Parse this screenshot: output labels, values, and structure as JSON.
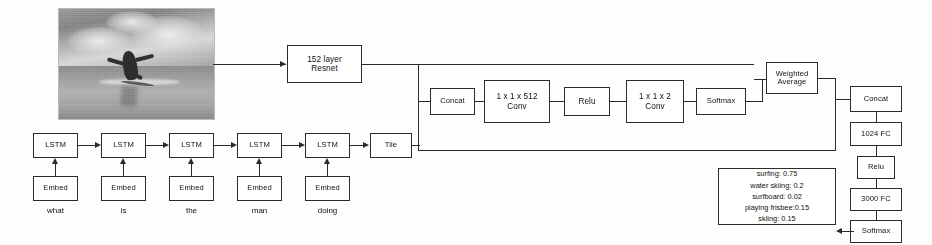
{
  "diagram": {
    "image_node": {
      "name": "surfer-photo",
      "alt": "grayscale photo of a man surfing on a wave"
    },
    "vision": {
      "resnet": "152 layer\nResnet"
    },
    "attention_row": [
      {
        "id": "concat",
        "label": "Concat"
      },
      {
        "id": "conv512",
        "label": "1 x 1 x 512\nConv"
      },
      {
        "id": "relu",
        "label": "Relu"
      },
      {
        "id": "conv2",
        "label": "1 x 1 x 2\nConv"
      },
      {
        "id": "softmax",
        "label": "Softmax"
      },
      {
        "id": "weighted-average",
        "label": "Weighted\nAverage"
      }
    ],
    "language": {
      "lstm_label": "LSTM",
      "embed_label": "Embed",
      "tile_label": "Tile",
      "cells": [
        {
          "lstm": "LSTM",
          "embed": "Embed",
          "word": "what"
        },
        {
          "lstm": "LSTM",
          "embed": "Embed",
          "word": "is"
        },
        {
          "lstm": "LSTM",
          "embed": "Embed",
          "word": "the"
        },
        {
          "lstm": "LSTM",
          "embed": "Embed",
          "word": "man"
        },
        {
          "lstm": "LSTM",
          "embed": "Embed",
          "word": "doing"
        }
      ]
    },
    "classifier_column": [
      {
        "id": "concat2",
        "label": "Concat"
      },
      {
        "id": "fc1024",
        "label": "1024 FC"
      },
      {
        "id": "relu2",
        "label": "Relu"
      },
      {
        "id": "fc3000",
        "label": "3000 FC"
      },
      {
        "id": "softmax2",
        "label": "Softmax"
      }
    ],
    "answers": [
      "surfing: 0.75",
      "water skiing: 0.2",
      "surfboard: 0.02",
      "playing frisbee:0.15",
      "skiing: 0.15"
    ],
    "colors": {
      "stroke": "#2a2a2a",
      "background": "#fdfdfd",
      "text": "#111111"
    }
  }
}
